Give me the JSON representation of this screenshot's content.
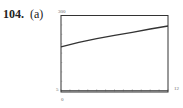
{
  "problem": {
    "number": "104.",
    "part": "(a)"
  },
  "labels": {
    "ymax": "300",
    "ymin": "5",
    "xmin": "0",
    "xmax": "12"
  },
  "colors": {
    "curve": "#333333",
    "frame": "#333333",
    "axis": "#333333"
  },
  "chart_data": {
    "type": "line",
    "title": "",
    "xlabel": "",
    "ylabel": "",
    "xlim": [
      0,
      12
    ],
    "ylim": [
      -5,
      300
    ],
    "grid": false,
    "legend": null,
    "x_ticks": [
      0,
      1,
      2,
      3,
      4,
      5,
      6,
      7,
      8,
      9,
      10,
      11,
      12
    ],
    "y_ticks_count": 7,
    "series": [
      {
        "name": "curve",
        "x": [
          0,
          2,
          4,
          6,
          8,
          10,
          12
        ],
        "y": [
          175,
          193,
          208,
          221,
          233,
          246,
          258
        ]
      }
    ],
    "window_labels": {
      "ymax": "300",
      "ymin": "5",
      "xmin": "0",
      "xmax": "12"
    }
  }
}
